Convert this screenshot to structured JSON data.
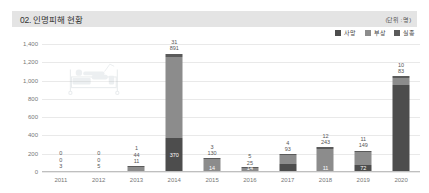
{
  "header": {
    "title": "02. 인명피해 현황",
    "unit": "(단위 : 명)"
  },
  "legend": {
    "items": [
      {
        "label": "사망",
        "color": "#4d4d4d"
      },
      {
        "label": "부상",
        "color": "#8c8c8c"
      },
      {
        "label": "실종",
        "color": "#5a5a5a"
      }
    ]
  },
  "watermark": {
    "name": "hospital-bed-watermark"
  },
  "chart_data": {
    "type": "bar",
    "title": "02. 인명피해 현황",
    "subtitle": "",
    "xlabel": "",
    "ylabel": "",
    "unit": "명",
    "stacked": true,
    "grid": true,
    "legend_position": "top-right",
    "ylim": [
      0,
      1400
    ],
    "yticks": [
      "0",
      "200",
      "400",
      "600",
      "800",
      "1,000",
      "1,200",
      "1,400"
    ],
    "ytick_values": [
      0,
      200,
      400,
      600,
      800,
      1000,
      1200,
      1400
    ],
    "categories": [
      "2011",
      "2012",
      "2013",
      "2014",
      "2015",
      "2016",
      "2017",
      "2018",
      "2019",
      "2020"
    ],
    "series": [
      {
        "name": "사망",
        "color": "#4d4d4d",
        "values": [
          3,
          5,
          11,
          370,
          14,
          14,
          93,
          11,
          72,
          950
        ]
      },
      {
        "name": "부상",
        "color": "#8c8c8c",
        "values": [
          0,
          0,
          44,
          891,
          130,
          25,
          93,
          243,
          149,
          83
        ]
      },
      {
        "name": "실종",
        "color": "#5a5a5a",
        "values": [
          0,
          0,
          1,
          31,
          3,
          5,
          4,
          12,
          11,
          10
        ]
      }
    ],
    "bar_labels": [
      {
        "category": "2011",
        "top": [
          "0",
          "0",
          "3"
        ],
        "inner": ""
      },
      {
        "category": "2012",
        "top": [
          "0",
          "0",
          "5"
        ],
        "inner": ""
      },
      {
        "category": "2013",
        "top": [
          "1",
          "44",
          "11"
        ],
        "inner": ""
      },
      {
        "category": "2014",
        "top": [
          "31",
          "891"
        ],
        "inner": "370"
      },
      {
        "category": "2015",
        "top": [
          "3",
          "130"
        ],
        "inner": "14"
      },
      {
        "category": "2016",
        "top": [
          "5",
          "25"
        ],
        "inner": "14"
      },
      {
        "category": "2017",
        "top": [
          "4",
          "93"
        ],
        "inner": ""
      },
      {
        "category": "2018",
        "top": [
          "12",
          "243"
        ],
        "inner": "11"
      },
      {
        "category": "2019",
        "top": [
          "11",
          "149"
        ],
        "inner": "72"
      },
      {
        "category": "2020",
        "top": [
          "10",
          "83"
        ],
        "inner": ""
      }
    ]
  }
}
